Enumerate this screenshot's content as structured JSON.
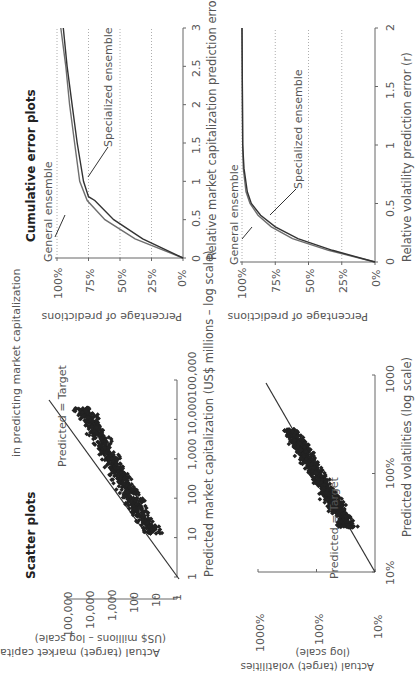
{
  "header": {
    "subtitle": "in predicting market capitalization"
  },
  "sections": {
    "scatter_title": "Scatter plots",
    "cumulative_title": "Cumulative error plots"
  },
  "chart_data": [
    {
      "type": "scatter",
      "title": "Scatter plots",
      "xlabel": "Predicted market capitalization (US$ millions – log scale)",
      "ylabel": "Actual (target) market capitalization (US$ millions – log scale)",
      "x_ticks": [
        "1",
        "10",
        "100",
        "1,000",
        "10,000",
        "100,000"
      ],
      "y_ticks": [
        "1",
        "10",
        "100",
        "1,000",
        "10,000",
        "100,000"
      ],
      "scale": "log",
      "annotation": "Predicted = Target",
      "reference_line": "y = x",
      "description": "Dense cloud of points clustered along the Predicted = Target diagonal, roughly from 10 to 30,000"
    },
    {
      "type": "line",
      "title": "Cumulative error plots",
      "xlabel": "Relative market capitalization prediction error (r)",
      "ylabel": "Percentage of predictions",
      "x_ticks": [
        "0",
        "0.5",
        "1",
        "1.5",
        "2",
        "2.5",
        "3"
      ],
      "y_ticks": [
        "0%",
        "25%",
        "50%",
        "75%",
        "100%"
      ],
      "xlim": [
        0,
        3
      ],
      "ylim": [
        0,
        100
      ],
      "grid": "horizontal dotted",
      "series": [
        {
          "name": "General ensemble",
          "x": [
            0,
            0.25,
            0.5,
            0.75,
            1,
            1.5,
            2,
            2.5,
            3
          ],
          "y": [
            0,
            38,
            62,
            76,
            82,
            86,
            90,
            93,
            97
          ]
        },
        {
          "name": "Specialized ensemble",
          "x": [
            0,
            0.25,
            0.5,
            0.75,
            0.8,
            1,
            1.5,
            2,
            2.5,
            3
          ],
          "y": [
            0,
            32,
            55,
            70,
            75,
            79,
            84,
            88,
            92,
            95
          ]
        }
      ]
    },
    {
      "type": "scatter",
      "xlabel": "Predicted volatilities (log scale)",
      "ylabel": "Actual (target) volatilities (log scale)",
      "x_ticks": [
        "10%",
        "100%",
        "1000"
      ],
      "y_ticks": [
        "10%",
        "100%",
        "1000%"
      ],
      "scale": "log",
      "annotation": "Predicted = Target",
      "reference_line": "y = x",
      "description": "Dense cloud of points roughly from 30% to 300% along the diagonal"
    },
    {
      "type": "line",
      "xlabel": "Relative volatility prediction error (r)",
      "ylabel": "Percentage of predictions",
      "x_ticks": [
        "0",
        "0.5",
        "1",
        "1.5",
        "2"
      ],
      "y_ticks": [
        "0%",
        "25%",
        "50%",
        "75%",
        "100%"
      ],
      "xlim": [
        0,
        2
      ],
      "ylim": [
        0,
        100
      ],
      "grid": "horizontal dotted",
      "series": [
        {
          "name": "General ensemble",
          "x": [
            0,
            0.1,
            0.2,
            0.3,
            0.4,
            0.5,
            0.6,
            0.8,
            1,
            2
          ],
          "y": [
            0,
            35,
            62,
            78,
            88,
            94,
            97,
            99,
            99.5,
            100
          ]
        },
        {
          "name": "Specialized ensemble",
          "x": [
            0,
            0.1,
            0.2,
            0.3,
            0.4,
            0.5,
            0.6,
            0.8,
            1,
            2
          ],
          "y": [
            0,
            32,
            58,
            75,
            86,
            93,
            96,
            98.5,
            99.5,
            100
          ]
        }
      ]
    }
  ],
  "labels": {
    "cap_cum_x": "Relative market capitalization prediction error (r)",
    "vol_cum_x": "Relative volatility prediction error (r)",
    "pct_y": "Percentage of predictions",
    "general": "General ensemble",
    "specialized": "Specialized ensemble",
    "cap_sc_x": "Predicted market capitalization (US$ millions – log scale)",
    "cap_sc_y1": "Actual (target) market capitalization",
    "cap_sc_y2": "(US$ millions – log scale)",
    "vol_sc_x": "Predicted volatilities (log scale)",
    "vol_sc_y1": "Actual (target) volatilities",
    "vol_sc_y2": "(log scale)",
    "pt": "Predicted = Target"
  },
  "ticks": {
    "cap_sc": [
      "1",
      "10",
      "100",
      "1,000",
      "10,000",
      "100,000"
    ],
    "vol_sc_x": [
      "10%",
      "100%",
      "1000"
    ],
    "vol_sc_y": [
      "10%",
      "100%",
      "1000%"
    ],
    "pct": [
      "0%",
      "25%",
      "50%",
      "75%",
      "100%"
    ],
    "cap_cum_x": [
      "0",
      "0.5",
      "1",
      "1.5",
      "2",
      "2.5",
      "3"
    ],
    "vol_cum_x": [
      "0",
      "0.5",
      "1",
      "1.5",
      "2"
    ]
  }
}
